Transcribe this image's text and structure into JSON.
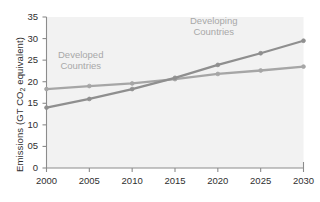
{
  "chart_data": {
    "type": "line",
    "title": "",
    "subtitle": "",
    "xlabel": "",
    "ylabel": "Emissions (GT CO2 equivalent)",
    "ylabel_parts": {
      "pre": "Emissions (GT CO",
      "sub": "2",
      "post": " equivalent)"
    },
    "x": [
      2000,
      2005,
      2010,
      2015,
      2020,
      2025,
      2030
    ],
    "xticklabels": [
      "2000",
      "2005",
      "2010",
      "2015",
      "2020",
      "2025",
      "2030"
    ],
    "yticks": [
      0,
      5,
      10,
      15,
      20,
      25,
      30,
      35
    ],
    "yticklabels": [
      "0",
      "05",
      "10",
      "15",
      "20",
      "25",
      "30",
      "35"
    ],
    "xlim": [
      2000,
      2030
    ],
    "ylim": [
      0,
      35
    ],
    "grid": false,
    "legend_position": "inline-annotations",
    "series": [
      {
        "name": "Developed Countries",
        "values": [
          18.3,
          19.0,
          19.6,
          20.6,
          21.8,
          22.6,
          23.5
        ],
        "color": "#a6a6a6",
        "marker": "circle"
      },
      {
        "name": "Developing Countries",
        "values": [
          14.0,
          16.0,
          18.3,
          20.9,
          23.9,
          26.6,
          29.5
        ],
        "color": "#8f8f8f",
        "marker": "circle"
      }
    ],
    "annotations": [
      {
        "text_line1": "Developed",
        "text_line2": "Countries",
        "series": "Developed Countries"
      },
      {
        "text_line1": "Developing",
        "text_line2": "Countries",
        "series": "Developing Countries"
      }
    ],
    "colors": {
      "page_background": "#ffffff",
      "plot_background": "#f2f2f2",
      "axis": "#8c8c8c",
      "tick_text": "#2f2f2f",
      "annotation_text": "#a8a8a8"
    }
  }
}
